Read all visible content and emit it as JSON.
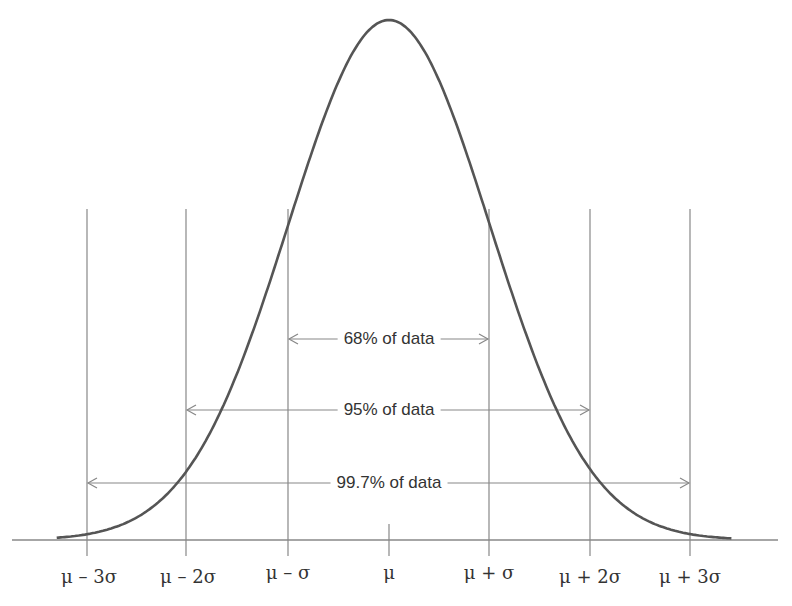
{
  "chart_data": {
    "type": "line",
    "title": "",
    "xlabel": "",
    "ylabel": "",
    "x_ticks": [
      "μ – 3σ",
      "μ – 2σ",
      "μ – σ",
      "μ",
      "μ + σ",
      "μ + 2σ",
      "μ + 3σ"
    ],
    "x_tick_sigma": [
      -3,
      -2,
      -1,
      0,
      1,
      2,
      3
    ],
    "xlim_sigma": [
      -3.75,
      3.85
    ],
    "grid": false,
    "series": [
      {
        "name": "normal density",
        "x_sigma_range": [
          -3.3,
          3.4
        ],
        "peak_at": 0
      }
    ],
    "annotations": [
      {
        "label": "68% of data",
        "from_sigma": -1,
        "to_sigma": 1
      },
      {
        "label": "95% of data",
        "from_sigma": -2,
        "to_sigma": 2
      },
      {
        "label": "99.7% of data",
        "from_sigma": -3,
        "to_sigma": 3
      }
    ],
    "colors": {
      "curve": "#555555",
      "lines": "#888888",
      "text": "#333333"
    }
  },
  "labels": {
    "ticks": [
      "μ – 3σ",
      "μ – 2σ",
      "μ – σ",
      "μ",
      "μ + σ",
      "μ + 2σ",
      "μ + 3σ"
    ],
    "ranges": [
      "68% of data",
      "95% of data",
      "99.7% of data"
    ]
  }
}
